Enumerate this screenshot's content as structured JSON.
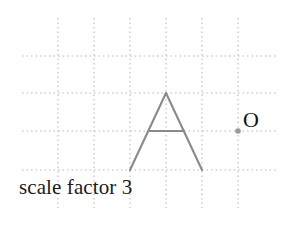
{
  "figure": {
    "title_text": "scale factor 3",
    "point_label": "O",
    "colors": {
      "grid": "#b9b9bd",
      "shape_stroke": "#8a8a8a",
      "point_marker": "#9a9a9a",
      "text": "#1b1b1b",
      "background": "#ffffff"
    },
    "grid": {
      "cell_size": 36,
      "vertical_lines_x": [
        58,
        94,
        130,
        166,
        202,
        238
      ],
      "horizontal_lines_y": [
        56,
        93,
        131,
        170
      ],
      "vertical_extent_y": [
        18,
        208
      ],
      "horizontal_extent_x": [
        22,
        278
      ]
    },
    "shape": {
      "name": "letter-A",
      "apex": [
        166,
        93
      ],
      "left_foot": [
        130,
        170
      ],
      "right_foot": [
        202,
        170
      ],
      "crossbar_left": [
        148.5,
        131
      ],
      "crossbar_right": [
        184,
        131
      ]
    },
    "centre_of_enlargement": {
      "x": 238,
      "y": 131,
      "radius": 2.8
    }
  }
}
